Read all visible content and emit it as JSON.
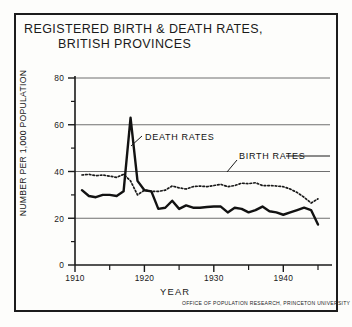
{
  "title": {
    "line1": "REGISTERED BIRTH & DEATH RATES,",
    "line2": "BRITISH PROVINCES"
  },
  "credit": "OFFICE OF POPULATION RESEARCH, PRINCETON UNIVERSITY",
  "axis": {
    "xlabel": "YEAR",
    "ylabel": "NUMBER PER 1,000 POPULATION",
    "yticks": [
      "0",
      "20",
      "40",
      "60",
      "80"
    ],
    "xticks": [
      "1910",
      "1920",
      "1930",
      "1940"
    ]
  },
  "annotations": {
    "death": "DEATH RATES",
    "birth": "BIRTH RATES"
  },
  "colors": {
    "ink": "#1a1a1a",
    "paper": "#fdfdfb",
    "gridline": "#6f6f6f"
  },
  "chart_data": {
    "type": "line",
    "title": "REGISTERED BIRTH & DEATH RATES, BRITISH PROVINCES",
    "xlabel": "YEAR",
    "ylabel": "NUMBER PER 1,000 POPULATION",
    "xlim": [
      1910,
      1946
    ],
    "ylim": [
      0,
      80
    ],
    "grid": true,
    "gridlines_y": [
      20,
      40,
      60,
      80
    ],
    "xticks_major": [
      1910,
      1920,
      1930,
      1940
    ],
    "xticks_minor": [
      1915,
      1925,
      1935,
      1945
    ],
    "yticks_major": [
      0,
      20,
      40,
      60,
      80
    ],
    "yticks_minor": [
      10,
      30,
      50,
      70
    ],
    "legend": "inline annotations",
    "x": [
      1911,
      1912,
      1913,
      1914,
      1915,
      1916,
      1917,
      1918,
      1919,
      1920,
      1921,
      1922,
      1923,
      1924,
      1925,
      1926,
      1927,
      1928,
      1929,
      1930,
      1931,
      1932,
      1933,
      1934,
      1935,
      1936,
      1937,
      1938,
      1939,
      1940,
      1941,
      1942,
      1943,
      1944,
      1945
    ],
    "series": [
      {
        "name": "BIRTH RATES",
        "style": "dotted",
        "values": [
          38.5,
          38.8,
          38.2,
          38.5,
          38.0,
          37.5,
          38.8,
          36.0,
          30.0,
          32.0,
          31.5,
          31.5,
          32.0,
          33.8,
          33.0,
          32.5,
          33.5,
          33.8,
          33.5,
          34.0,
          34.5,
          33.5,
          34.0,
          35.0,
          34.8,
          35.2,
          34.0,
          34.0,
          33.8,
          33.5,
          32.5,
          31.0,
          29.0,
          26.5,
          28.3
        ]
      },
      {
        "name": "DEATH RATES",
        "style": "solid",
        "values": [
          32.0,
          29.5,
          29.0,
          30.0,
          30.0,
          29.5,
          31.5,
          63.0,
          36.0,
          32.0,
          31.5,
          24.0,
          24.5,
          27.5,
          24.0,
          25.5,
          24.5,
          24.5,
          24.8,
          25.0,
          25.0,
          22.5,
          24.5,
          24.0,
          22.5,
          23.5,
          25.0,
          23.0,
          22.5,
          21.5,
          22.5,
          23.5,
          24.5,
          23.5,
          17.3
        ]
      }
    ],
    "annotations": [
      {
        "text": "DEATH RATES",
        "points_to_year": 1918,
        "points_to_value": 52
      },
      {
        "text": "BIRTH RATES",
        "points_to_year": 1929,
        "points_to_value": 34
      }
    ]
  }
}
